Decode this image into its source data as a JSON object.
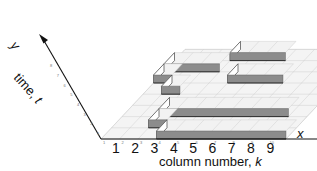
{
  "diagram": {
    "type": "3d-isometric-block-grid",
    "x_axis": {
      "label_prefix": "column number,",
      "label_var": "k",
      "arrow_label": "x",
      "big_ticks": [
        "1",
        "2",
        "3",
        "4",
        "5",
        "6",
        "7",
        "8",
        "9"
      ],
      "small_ticks": [
        "1",
        "2",
        "3",
        "4",
        "5",
        "6",
        "7",
        "8",
        "9",
        "10"
      ]
    },
    "y_axis": {
      "label_prefix": "time,",
      "label_var": "t",
      "arrow_label": "y",
      "small_ticks": [
        "1",
        "2",
        "3",
        "4",
        "5",
        "6",
        "7",
        "8"
      ]
    },
    "colors": {
      "grid_line": "#c8c8c8",
      "grid_fill": "#f4f4f4",
      "block_top": "#f2f2f2",
      "block_front": "#8c8c8c",
      "block_side": "#ffffff",
      "axis": "#111111"
    },
    "blocks": [
      {
        "row": 1,
        "k_start": 4,
        "k_end": 10
      },
      {
        "row": 2,
        "k_start": 3,
        "k_end": 3
      },
      {
        "row": 3,
        "k_start": 3,
        "k_end": 9
      },
      {
        "row": 5,
        "k_start": 2,
        "k_end": 2
      },
      {
        "row": 6,
        "k_start": 5,
        "k_end": 7
      },
      {
        "row": 6,
        "k_start": 1,
        "k_end": 1
      },
      {
        "row": 7,
        "k_start": 1,
        "k_end": 3
      },
      {
        "row": 8,
        "k_start": 4,
        "k_end": 6
      }
    ]
  }
}
